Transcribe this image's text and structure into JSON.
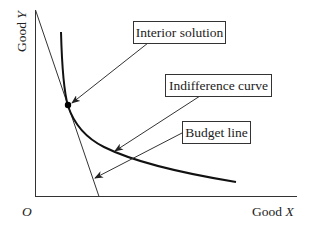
{
  "figure": {
    "type": "consumer-choice-diagram",
    "axes": {
      "y_label_text": "Good ",
      "y_label_var": "Y",
      "x_label_text": "Good ",
      "x_label_var": "X",
      "origin_label": "O"
    },
    "elements": {
      "budget_line": "Budget line",
      "indifference_curve": "Indifference curve",
      "optimum_point": "Interior solution"
    },
    "annotations": [
      {
        "id": "interior",
        "text": "Interior solution",
        "target": "optimum_point"
      },
      {
        "id": "indifference",
        "text": "Indifference curve",
        "target": "indifference_curve"
      },
      {
        "id": "budget",
        "text": "Budget line",
        "target": "budget_line"
      }
    ],
    "colors": {
      "stroke": "#222222",
      "background": "#ffffff"
    }
  }
}
